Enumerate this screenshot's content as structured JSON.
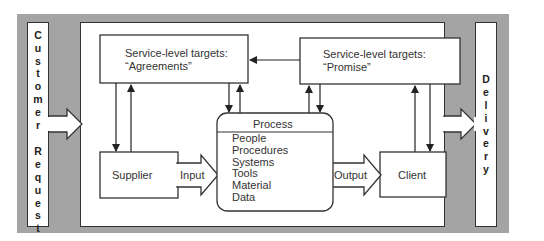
{
  "diagram": {
    "left_column": {
      "label": "Customer Request",
      "letters_word1": [
        "C",
        "u",
        "s",
        "t",
        "o",
        "m",
        "e",
        "r"
      ],
      "letters_word2": [
        "R",
        "e",
        "q",
        "u",
        "e",
        "s",
        "t"
      ]
    },
    "right_column": {
      "label": "Delivery",
      "letters": [
        "D",
        "e",
        "l",
        "i",
        "v",
        "e",
        "r",
        "y"
      ]
    },
    "agreements_box": {
      "line1": "Service-level targets:",
      "line2": "“Agreements”"
    },
    "promise_box": {
      "line1": "Service-level targets:",
      "line2": "“Promise”"
    },
    "process_box": {
      "title": "Process",
      "items": [
        "People",
        "Procedures",
        "Systems",
        "Tools",
        "Material",
        "Data"
      ]
    },
    "supplier_box": {
      "label": "Supplier"
    },
    "client_box": {
      "label": "Client"
    },
    "input_arrow": {
      "label": "Input"
    },
    "output_arrow": {
      "label": "Output"
    },
    "colors": {
      "band": "#a4a4a4",
      "stroke": "#333333",
      "fill": "#ffffff"
    }
  }
}
